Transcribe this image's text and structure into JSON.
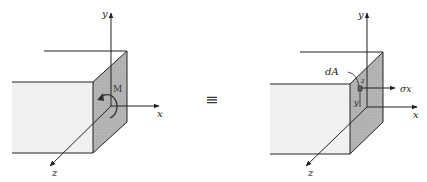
{
  "left_figure": {
    "axes": {
      "x": "x",
      "y": "y",
      "z": "z"
    },
    "moment_label": "M"
  },
  "equivalence_symbol": "≡",
  "right_figure": {
    "axes": {
      "x": "x",
      "y": "y",
      "z": "z"
    },
    "area_label": "dA",
    "coord_y": "y",
    "coord_z": "z",
    "stress_label": "σx"
  },
  "colors": {
    "front_face": "#f2f2f2",
    "side_face": "#b8b8b8",
    "line": "#222222"
  }
}
